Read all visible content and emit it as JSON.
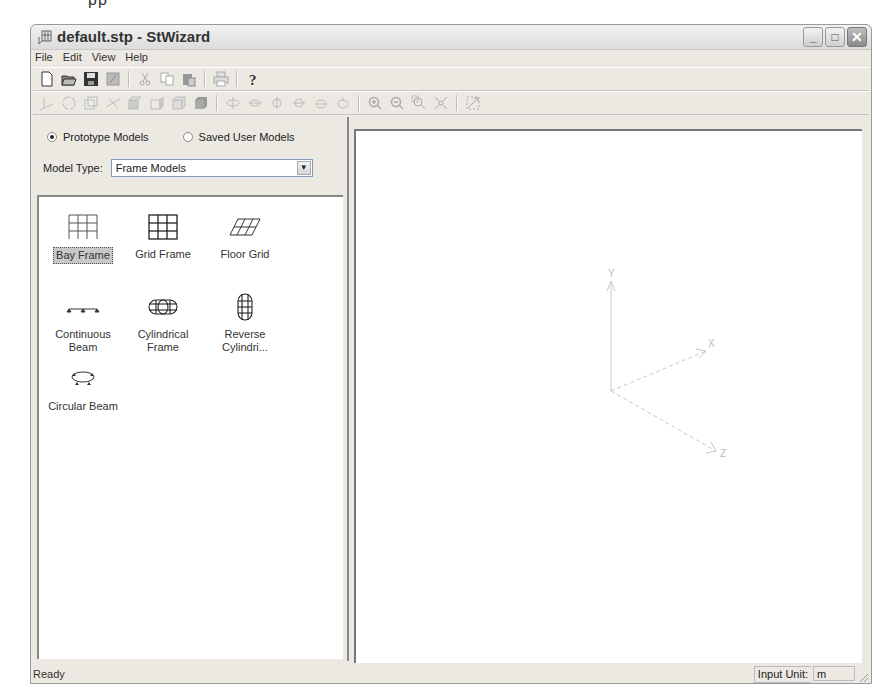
{
  "page_fragment": "pp",
  "window": {
    "title": "default.stp - StWizard",
    "controls": {
      "minimize": "_",
      "maximize": "□",
      "close": "✕"
    }
  },
  "menu": [
    {
      "label": "File",
      "mnemonic": "F"
    },
    {
      "label": "Edit",
      "mnemonic": "E"
    },
    {
      "label": "View",
      "mnemonic": "V"
    },
    {
      "label": "Help",
      "mnemonic": "H"
    }
  ],
  "toolbar_main": [
    "new-icon",
    "open-icon",
    "save-icon",
    "save-as-icon",
    "cut-icon",
    "copy-icon",
    "paste-icon",
    "print-icon",
    "help-icon"
  ],
  "toolbar_view": [
    "axis-icon",
    "rotate-icon",
    "wireframe-icon",
    "node-icon",
    "front-face-icon",
    "side-face-icon",
    "box-icon",
    "solid-icon",
    "rotate-up-icon",
    "rotate-down-icon",
    "rotate-left-icon",
    "rotate-right-icon",
    "rotate-cw-icon",
    "rotate-ccw-icon",
    "zoom-in-icon",
    "zoom-out-icon",
    "zoom-window-icon",
    "zoom-fit-icon",
    "pan-icon"
  ],
  "left_panel": {
    "source_options": [
      {
        "label": "Prototype Models",
        "selected": true
      },
      {
        "label": "Saved User Models",
        "selected": false
      }
    ],
    "model_type_label": "Model Type:",
    "model_type_value": "Frame Models",
    "models": [
      {
        "label": "Bay Frame",
        "icon": "bay-frame-icon",
        "selected": true
      },
      {
        "label": "Grid Frame",
        "icon": "grid-frame-icon",
        "selected": false
      },
      {
        "label": "Floor Grid",
        "icon": "floor-grid-icon",
        "selected": false
      },
      {
        "label": "Continuous Beam",
        "line1": "Continuous",
        "line2": "Beam",
        "icon": "continuous-beam-icon",
        "selected": false
      },
      {
        "label": "Cylindrical Frame",
        "line1": "Cylindrical",
        "line2": "Frame",
        "icon": "cylindrical-frame-icon",
        "selected": false
      },
      {
        "label": "Reverse Cylindri...",
        "line1": "Reverse",
        "line2": "Cylindri...",
        "icon": "reverse-cylindrical-icon",
        "selected": false
      },
      {
        "label": "Circular Beam",
        "icon": "circular-beam-icon",
        "selected": false
      }
    ]
  },
  "view3d": {
    "axes": {
      "y": "Y",
      "x": "X",
      "z": "Z"
    },
    "axis_color": "#c8c8c8"
  },
  "status": {
    "text": "Ready",
    "unit_label": "Input Unit:",
    "unit_value": "m"
  }
}
